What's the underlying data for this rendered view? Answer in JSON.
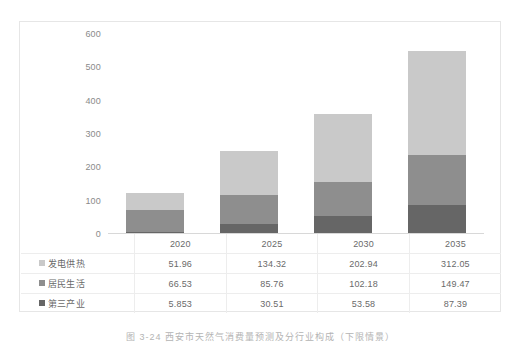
{
  "chart_data": {
    "type": "bar",
    "subtype": "stacked-bar",
    "title": "",
    "xlabel": "",
    "ylabel": "",
    "ylim": [
      0,
      600
    ],
    "yticks": [
      600,
      500,
      400,
      300,
      200,
      100,
      0
    ],
    "grid": false,
    "legend_position": "table-left-column",
    "categories": [
      "2020",
      "2025",
      "2030",
      "2035"
    ],
    "series": [
      {
        "name": "发电供热",
        "color": "#c9c9c9",
        "stack_order": "top",
        "values": [
          51.96,
          134.32,
          202.94,
          312.05
        ],
        "value_labels": [
          "51.96",
          "134.32",
          "202.94",
          "312.05"
        ]
      },
      {
        "name": "居民生活",
        "color": "#8e8e8e",
        "stack_order": "middle",
        "values": [
          66.53,
          85.76,
          102.18,
          149.47
        ],
        "value_labels": [
          "66.53",
          "85.76",
          "102.18",
          "149.47"
        ]
      },
      {
        "name": "第三产业",
        "color": "#666666",
        "stack_order": "bottom",
        "values": [
          5.853,
          30.51,
          53.58,
          87.39
        ],
        "value_labels": [
          "5.853",
          "30.51",
          "53.58",
          "87.39"
        ]
      }
    ],
    "stack_totals": [
      124.343,
      250.59,
      358.7,
      548.91
    ]
  },
  "table": {
    "corner_label": "",
    "column_headers": [
      "2020",
      "2025",
      "2030",
      "2035"
    ],
    "rows": [
      {
        "label": "发电供热",
        "swatch": "#c9c9c9",
        "cells": [
          "51.96",
          "134.32",
          "202.94",
          "312.05"
        ]
      },
      {
        "label": "居民生活",
        "swatch": "#8e8e8e",
        "cells": [
          "66.53",
          "85.76",
          "102.18",
          "149.47"
        ]
      },
      {
        "label": "第三产业",
        "swatch": "#666666",
        "cells": [
          "5.853",
          "30.51",
          "53.58",
          "87.39"
        ]
      }
    ]
  },
  "axis": {
    "y_tick_labels": [
      "600",
      "500",
      "400",
      "300",
      "200",
      "100",
      "0"
    ]
  },
  "caption": {
    "text": "图 3-24  西安市天然气消费量预测及分行业构成（下限情景）"
  },
  "colors": {
    "series_light": "#c9c9c9",
    "series_medium": "#8e8e8e",
    "series_dark": "#666666",
    "frame": "#e6e6e6",
    "grid_line": "#ededed",
    "text": "#6a6a6a",
    "axis_text": "#8a8a8a"
  }
}
